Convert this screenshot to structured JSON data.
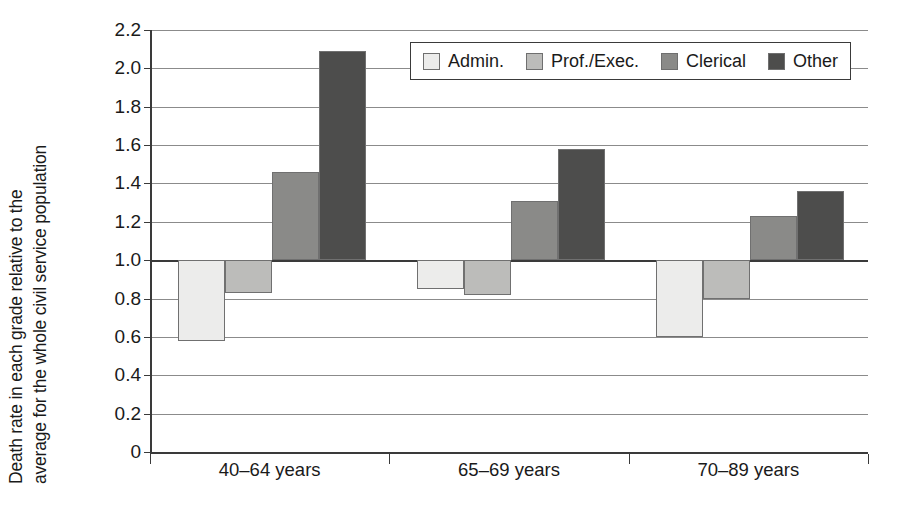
{
  "chart_data": {
    "type": "bar",
    "title": "",
    "xlabel": "",
    "ylabel_line1": "Death rate in each grade relative to the",
    "ylabel_line2": "average for the whole civil service population",
    "categories": [
      "40–64 years",
      "65–69 years",
      "70–89 years"
    ],
    "series": [
      {
        "name": "Admin.",
        "color": "#ececeb",
        "values": [
          0.58,
          0.85,
          0.6
        ]
      },
      {
        "name": "Prof./Exec.",
        "color": "#bcbcba",
        "values": [
          0.83,
          0.82,
          0.8
        ]
      },
      {
        "name": "Clerical",
        "color": "#8a8a88",
        "values": [
          1.46,
          1.31,
          1.23
        ]
      },
      {
        "name": "Other",
        "color": "#4d4d4c",
        "values": [
          2.09,
          1.58,
          1.36
        ]
      }
    ],
    "baseline": 1.0,
    "ylim": [
      0,
      2.2
    ],
    "yticks": [
      0,
      0.2,
      0.4,
      0.6,
      0.8,
      1.0,
      1.2,
      1.4,
      1.6,
      1.8,
      2.0,
      2.2
    ],
    "ytick_labels": [
      "0",
      "0.2",
      "0.4",
      "0.6",
      "0.8",
      "1.0",
      "1.2",
      "1.4",
      "1.6",
      "1.8",
      "2.0",
      "2.2"
    ],
    "grid": true,
    "legend_position": "top-right",
    "axis_color": "#3a3a3a",
    "grid_color": "#8b8b8b"
  },
  "legend": {
    "entries": [
      {
        "label": "Admin.",
        "swatch": "legend-swatch-admin"
      },
      {
        "label": "Prof./Exec.",
        "swatch": "legend-swatch-prof-exec"
      },
      {
        "label": "Clerical",
        "swatch": "legend-swatch-clerical"
      },
      {
        "label": "Other",
        "swatch": "legend-swatch-other"
      }
    ]
  }
}
